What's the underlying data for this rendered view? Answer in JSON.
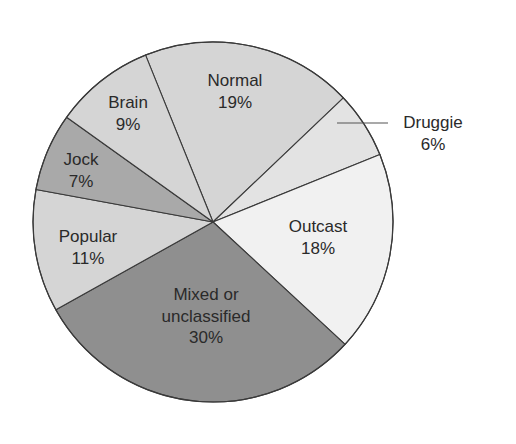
{
  "chart_data": {
    "type": "pie",
    "title": "",
    "categories": [
      "Normal",
      "Druggie",
      "Outcast",
      "Mixed or unclassified",
      "Popular",
      "Jock",
      "Brain"
    ],
    "values": [
      19,
      6,
      18,
      30,
      11,
      7,
      9
    ],
    "unit": "%",
    "start_angle_deg_clockwise_from_top": -22,
    "slices": [
      {
        "name": "Normal",
        "label_lines": [
          "Normal",
          "19%"
        ],
        "value": 19,
        "color": "#d5d5d5",
        "label_x": 235,
        "label_y": 86
      },
      {
        "name": "Druggie",
        "label_lines": [
          "Druggie",
          "6%"
        ],
        "value": 6,
        "color": "#e3e3e3",
        "label_x": 433,
        "label_y": 128,
        "external_label": true,
        "leader_line": {
          "x1": 337,
          "y1": 128,
          "x2": 388,
          "y2": 128
        }
      },
      {
        "name": "Outcast",
        "label_lines": [
          "Outcast",
          "18%"
        ],
        "value": 18,
        "color": "#f1f1f1",
        "label_x": 318,
        "label_y": 232
      },
      {
        "name": "Mixed or unclassified",
        "label_lines": [
          "Mixed or",
          "unclassified",
          "30%"
        ],
        "value": 30,
        "color": "#8f8f8f",
        "label_x": 206,
        "label_y": 300
      },
      {
        "name": "Popular",
        "label_lines": [
          "Popular",
          "11%"
        ],
        "value": 11,
        "color": "#d5d5d5",
        "label_x": 88,
        "label_y": 242
      },
      {
        "name": "Jock",
        "label_lines": [
          "Jock",
          "7%"
        ],
        "value": 7,
        "color": "#a9a9a9",
        "label_x": 81,
        "label_y": 165
      },
      {
        "name": "Brain",
        "label_lines": [
          "Brain",
          "9%"
        ],
        "value": 9,
        "color": "#d5d5d5",
        "label_x": 128,
        "label_y": 108
      }
    ],
    "legend": null,
    "center": [
      213,
      222
    ],
    "radius": 180,
    "stroke_color": "#3a3a3a"
  }
}
